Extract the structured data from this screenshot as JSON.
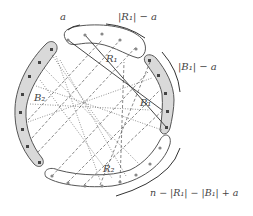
{
  "labels": {
    "a": "a",
    "r1_minus_a": "|R₁| − a",
    "b1_minus_a": "|B₁| − a",
    "remainder": "n − |R₁| − |B₁| + a",
    "R1": "R₁",
    "B1": "B₁",
    "B2": "B₂",
    "R2": "R₂"
  },
  "groups": [
    {
      "id": "R1",
      "color": "#ffffff",
      "nodes": 5,
      "position": "top"
    },
    {
      "id": "B1",
      "color": "#d9d9d9",
      "nodes": 5,
      "position": "right"
    },
    {
      "id": "B2",
      "color": "#d9d9d9",
      "nodes": 7,
      "position": "left"
    },
    {
      "id": "R2",
      "color": "#ffffff",
      "nodes": 9,
      "position": "bottom"
    }
  ],
  "edge_styles": [
    "solid",
    "dashed",
    "dotted"
  ]
}
